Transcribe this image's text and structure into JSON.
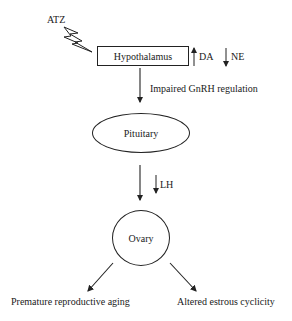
{
  "diagram": {
    "trigger": {
      "label": "ATZ",
      "icon": "lightning-bolt-icon"
    },
    "nodes": {
      "hypothalamus": "Hypothalamus",
      "pituitary": "Pituitary",
      "ovary": "Ovary"
    },
    "hypothalamus_effects": {
      "da": {
        "direction": "up",
        "label": "DA"
      },
      "ne": {
        "direction": "down",
        "label": "NE"
      }
    },
    "edges": {
      "hypothalamus_to_pituitary": "Impaired GnRH regulation",
      "pituitary_to_ovary": {
        "direction": "down",
        "label": "LH"
      }
    },
    "outcomes": [
      "Premature reproductive aging",
      "Altered estrous cyclicity"
    ]
  }
}
